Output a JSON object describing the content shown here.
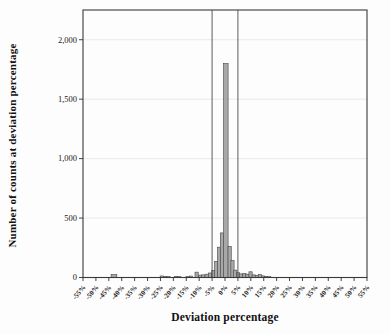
{
  "figure": {
    "background": "#fdfdfd",
    "border_color": "#3a3a3a",
    "axis_color": "#2f2f2f",
    "tick_text_color": "#1a1a1a",
    "bar_fill": "#a8a8a8",
    "bar_stroke": "#454545",
    "grid_color": "#e3e3e3",
    "ref_line_color": "#4a4a4a"
  },
  "chart_data": {
    "type": "bar",
    "title": "",
    "xlabel": "Deviation percentage",
    "ylabel": "Number of counts at deviation percentage",
    "xlim": [
      -55,
      55
    ],
    "ylim": [
      0,
      2250
    ],
    "grid": "horizontal-faint",
    "legend": "none",
    "x_tick_values": [
      -55,
      -50,
      -45,
      -40,
      -35,
      -30,
      -25,
      -20,
      -15,
      -10,
      -5,
      0,
      5,
      10,
      15,
      20,
      25,
      30,
      35,
      40,
      45,
      50,
      55
    ],
    "x_tick_labels": [
      "-55%",
      "-50%",
      "-45%",
      "-40%",
      "-35%",
      "-30%",
      "-25%",
      "-20%",
      "-15%",
      "-10%",
      "-5%",
      "0%",
      "5%",
      "10%",
      "15%",
      "20%",
      "25%",
      "30%",
      "35%",
      "40%",
      "45%",
      "50%",
      "55%"
    ],
    "y_tick_values": [
      0,
      500,
      1000,
      1500,
      2000
    ],
    "y_tick_labels": [
      "0",
      "500",
      "1,000",
      "1,500",
      "2,000"
    ],
    "reference_lines_x": [
      -5,
      5
    ],
    "bin_width": 1.25,
    "bins": [
      {
        "x": -43.0,
        "count": 25,
        "w": 2.2
      },
      {
        "x": -24.5,
        "count": 13
      },
      {
        "x": -23.2,
        "count": 10
      },
      {
        "x": -21.9,
        "count": 8
      },
      {
        "x": -19.0,
        "count": 10
      },
      {
        "x": -17.7,
        "count": 7
      },
      {
        "x": -14.5,
        "count": 8
      },
      {
        "x": -13.2,
        "count": 12
      },
      {
        "x": -11.0,
        "count": 45
      },
      {
        "x": -9.7,
        "count": 20
      },
      {
        "x": -8.4,
        "count": 22
      },
      {
        "x": -7.1,
        "count": 28
      },
      {
        "x": -5.8,
        "count": 38
      },
      {
        "x": -4.5,
        "count": 60
      },
      {
        "x": -3.4,
        "count": 135
      },
      {
        "x": -2.3,
        "count": 255
      },
      {
        "x": -1.2,
        "count": 375
      },
      {
        "x": 0.3,
        "count": 1800,
        "w": 1.8
      },
      {
        "x": 1.8,
        "count": 260
      },
      {
        "x": 2.9,
        "count": 143
      },
      {
        "x": 4.0,
        "count": 62
      },
      {
        "x": 5.1,
        "count": 40
      },
      {
        "x": 6.3,
        "count": 30
      },
      {
        "x": 7.5,
        "count": 35
      },
      {
        "x": 8.7,
        "count": 28
      },
      {
        "x": 9.9,
        "count": 48
      },
      {
        "x": 11.1,
        "count": 22
      },
      {
        "x": 12.3,
        "count": 18
      },
      {
        "x": 13.5,
        "count": 25
      },
      {
        "x": 14.7,
        "count": 14
      },
      {
        "x": 15.9,
        "count": 10
      },
      {
        "x": 17.1,
        "count": 7
      }
    ]
  }
}
